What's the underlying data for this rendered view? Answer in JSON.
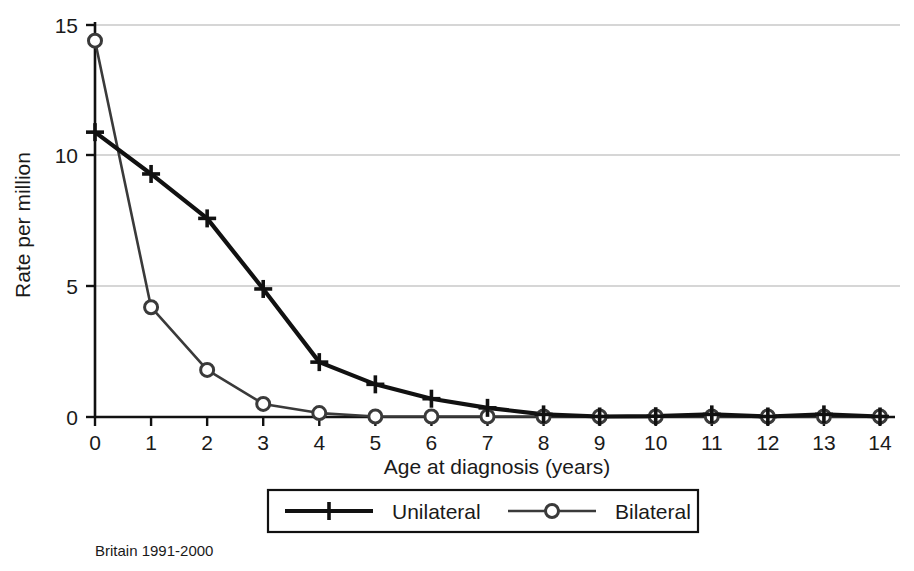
{
  "chart_data": {
    "type": "line",
    "title": "",
    "subtitle": "",
    "xlabel": "Age at diagnosis (years)",
    "ylabel": "Rate per million",
    "x": [
      0,
      1,
      2,
      3,
      4,
      5,
      6,
      7,
      8,
      9,
      10,
      11,
      12,
      13,
      14
    ],
    "xticklabels": [
      "0",
      "1",
      "2",
      "3",
      "4",
      "5",
      "6",
      "7",
      "8",
      "9",
      "10",
      "11",
      "12",
      "13",
      "14"
    ],
    "yticklabels": [
      "0",
      "5",
      "10",
      "15"
    ],
    "yticks": [
      0,
      5,
      10,
      15
    ],
    "xlim": [
      0,
      14
    ],
    "ylim": [
      0,
      15
    ],
    "grid": "horizontal",
    "legend_position": "below-axis-centered",
    "series": [
      {
        "name": "Unilateral",
        "marker": "plus",
        "color": "#111111",
        "linewidth": "thick",
        "values": [
          10.9,
          9.3,
          7.6,
          4.9,
          2.1,
          1.25,
          0.7,
          0.35,
          0.1,
          0.02,
          0.03,
          0.1,
          0.02,
          0.1,
          0.02
        ]
      },
      {
        "name": "Bilateral",
        "marker": "circle",
        "color": "#3a3a3a",
        "linewidth": "thin",
        "values": [
          14.4,
          4.2,
          1.8,
          0.5,
          0.15,
          0.02,
          0.02,
          0.02,
          0.02,
          0.02,
          0.02,
          0.02,
          0.02,
          0.02,
          0.02
        ]
      }
    ],
    "annotations": [
      {
        "name": "source-caption",
        "text": "Britain 1991-2000"
      }
    ]
  },
  "axes": {
    "y_title": "Rate per million",
    "x_title": "Age at diagnosis (years)"
  },
  "legend": {
    "items": [
      {
        "label": "Unilateral",
        "marker": "plus-marker-icon"
      },
      {
        "label": "Bilateral",
        "marker": "circle-marker-icon"
      }
    ]
  },
  "caption": {
    "text": "Britain 1991-2000"
  },
  "colors": {
    "unilateral": "#111111",
    "bilateral": "#3a3a3a",
    "grid": "#c8c8c8",
    "axis": "#111111",
    "background": "#ffffff"
  }
}
